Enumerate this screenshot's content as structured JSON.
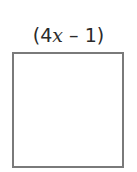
{
  "diagram": {
    "shape": "square",
    "side_label": {
      "open_paren": "(",
      "coefficient": "4",
      "variable": "x",
      "operator": " – ",
      "constant": "1",
      "close_paren": ")",
      "full_text": "(4x – 1)"
    },
    "colors": {
      "stroke": "#7a7a7a",
      "text": "#2a2a2a",
      "fill": "#ffffff"
    }
  }
}
